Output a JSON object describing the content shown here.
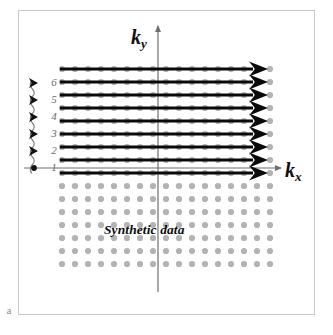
{
  "figure": {
    "subfigure_label": "a",
    "annotation": "Synthetic data",
    "axes": {
      "x_label_base": "k",
      "x_label_sub": "x",
      "y_label_base": "k",
      "y_label_sub": "y"
    },
    "colors": {
      "frame": "#c9c9c9",
      "axis": "#6f6f6f",
      "trajectory": "#0a0a0a",
      "sample_dot": "#b3b3b3",
      "index_text": "#6a6a6a",
      "label_text": "#101010",
      "background": "#ffffff"
    },
    "line_index_labels": [
      "1",
      "2",
      "3",
      "4",
      "5",
      "6"
    ],
    "line_index_markers": [
      "dot",
      "arrow",
      "arrow",
      "arrow",
      "arrow",
      "arrow"
    ]
  },
  "chart_data": {
    "type": "scatter",
    "title": "",
    "subtitle": "",
    "xlabel": "kx",
    "ylabel": "ky",
    "grid": false,
    "legend": null,
    "annotations": [
      {
        "text": "Synthetic data",
        "x_px": 104,
        "y_px": 222
      },
      {
        "text": "a",
        "x_px": 2,
        "y_px": 303
      }
    ],
    "axis_origin_px": {
      "x": 158,
      "y": 172
    },
    "trajectory": {
      "count": 9,
      "direction": "left-to-right",
      "x_start_px": 60,
      "x_end_px": 268,
      "y_px": [
        69,
        82,
        95,
        108,
        121,
        134,
        147,
        160,
        173
      ],
      "ky_index": [
        9,
        8,
        7,
        6,
        5,
        4,
        3,
        2,
        1
      ]
    },
    "sample_grid": {
      "columns": 17,
      "rows_total": 16,
      "x_start_px": 62,
      "x_step_px": 13,
      "y_start_px": 69,
      "y_step_px": 13,
      "dot_radius_px": 3.1
    },
    "labeled_indices": {
      "values": [
        1,
        2,
        3,
        4,
        5,
        6
      ],
      "y_px": [
        171,
        154,
        137,
        120,
        103,
        86
      ],
      "x_px": 48
    }
  }
}
